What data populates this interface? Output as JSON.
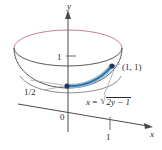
{
  "figure": {
    "axes": {
      "y_label": "y",
      "x_label": "x",
      "origin_label": "0",
      "y_tick_label": "1",
      "x_tick_label": "1"
    },
    "annotations": {
      "half_label": "1/2",
      "point_label": "(1, 1)",
      "equation": {
        "lhs": "x",
        "equals": "=",
        "radical_sign": "√",
        "radicand": "2y − 1",
        "full_text": "x = √(2y − 1)"
      }
    },
    "colors": {
      "axis": "#3a3a3a",
      "outline": "#555555",
      "curve": "#2f74a8",
      "curve_highlight": "#7fb4d8",
      "back_arc": "#c98c97",
      "point": "#1b3a5c",
      "text": "#2b2b2b",
      "leader": "#8a8a8a",
      "background": "#ffffff"
    },
    "geometry": {
      "ellipse_center": [
        68,
        48
      ],
      "ellipse_rx": 54,
      "ellipse_ry": 18,
      "bowl_bottom": [
        68,
        86
      ],
      "point_on_rim": [
        112,
        66
      ],
      "point_on_axis": [
        67,
        86
      ]
    }
  }
}
